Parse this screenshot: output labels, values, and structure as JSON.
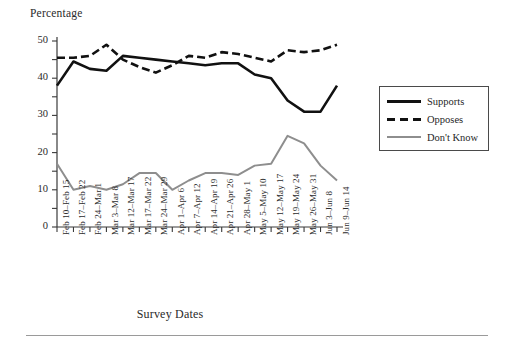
{
  "chart_data": {
    "type": "line",
    "title": "",
    "ylabel": "Percentage",
    "xlabel": "Survey Dates",
    "ylim": [
      0,
      50
    ],
    "yticks": [
      0,
      10,
      20,
      30,
      40,
      50
    ],
    "yticks_minor": [
      5,
      15,
      25,
      35,
      45
    ],
    "grid": false,
    "legend_position": "right",
    "categories": [
      "Feb 10–Feb 15",
      "Feb 17–Feb 22",
      "Feb 24–Mar 1",
      "Mar 3–Mar 8",
      "Mar 12–Mar 17",
      "Mar 17–Mar 22",
      "Mar 24–Mar 29",
      "Apr 1–Apr 6",
      "Apr 7–Apr 12",
      "Apr 14–Apr 19",
      "Apr 21–Apr 26",
      "Apr 28–May 1",
      "May 5–May 10",
      "May 12–May 17",
      "May 19–May 24",
      "May 26–May 31",
      "Jun 3–Jun 8",
      "Jun 9–Jun 14"
    ],
    "series": [
      {
        "name": "Supports",
        "style": "solid",
        "color": "#111111",
        "values": [
          38,
          44.5,
          42.5,
          42,
          46,
          45.5,
          45,
          44.5,
          44,
          43.5,
          44,
          44,
          41,
          40,
          34,
          31,
          31,
          38
        ]
      },
      {
        "name": "Opposes",
        "style": "dashed",
        "color": "#111111",
        "values": [
          45.5,
          45.5,
          46,
          49,
          45,
          43,
          41.5,
          43.5,
          46,
          45.5,
          47,
          46.5,
          45.5,
          44.5,
          47.5,
          47,
          47.5,
          49
        ]
      },
      {
        "name": "Don't Know",
        "style": "solid",
        "color": "#8e8e8e",
        "values": [
          17,
          10,
          11,
          10,
          11.5,
          14.5,
          14.5,
          10,
          12.5,
          14.5,
          14.5,
          14,
          16.5,
          17,
          24.5,
          22.5,
          16.5,
          12.5
        ]
      }
    ]
  },
  "legend": {
    "entries": [
      {
        "label": "Supports"
      },
      {
        "label": "Opposes"
      },
      {
        "label": "Don't Know"
      }
    ]
  },
  "colors": {
    "supports": "#111111",
    "opposes": "#111111",
    "dont_know": "#8e8e8e",
    "axis": "#3a3a3a",
    "background": "#ffffff"
  }
}
